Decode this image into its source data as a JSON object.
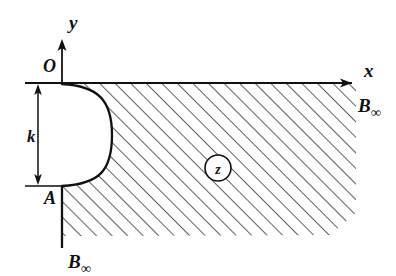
{
  "figure": {
    "kind": "complex-plane-region-diagram",
    "width": 396,
    "height": 276,
    "background_color": "#ffffff",
    "ink_color": "#111111"
  },
  "axes": {
    "x_axis": {
      "label": "x",
      "direction": "right",
      "arrowhead": true,
      "y_position": 83,
      "x_start": 25,
      "x_end": 358
    },
    "y_axis": {
      "label": "y",
      "direction": "up",
      "arrowhead": true,
      "x_position": 62,
      "y_start": 83,
      "y_end": 38
    },
    "origin_label": "O"
  },
  "points": {
    "origin": {
      "label": "O",
      "x": 62,
      "y": 83
    },
    "A": {
      "label": "A",
      "x": 62,
      "y": 186
    }
  },
  "dimension": {
    "label": "k",
    "description": "vertical double-arrow between the level of O and the level of A",
    "from_y": 83,
    "to_y": 186,
    "arrow_x": 38,
    "tick_x_start": 25,
    "tick_x_end": 62,
    "double_headed": true
  },
  "boundary": {
    "indentation": {
      "shape": "semicircular-bulge",
      "from": "O",
      "to": "A",
      "max_x": 110,
      "mid_y": 135
    },
    "lower_vertical_segment": {
      "from_x": 62,
      "from_y": 186,
      "to_x": 62,
      "to_y": 248
    }
  },
  "labels": {
    "b_infinity_right": {
      "base": "B",
      "subscript": "∞",
      "x": 368,
      "y": 112
    },
    "b_infinity_bottom": {
      "base": "B",
      "subscript": "∞",
      "x": 66,
      "y": 264
    },
    "region": {
      "text": "z",
      "circled": true,
      "cx": 218,
      "cy": 168,
      "r": 13
    }
  },
  "hatching": {
    "description": "45-degree parallel lines rising to the right filling the region right of the indented boundary and below the x-axis",
    "angle_degrees": 45,
    "spacing_px": 11,
    "stroke_width": 1.3,
    "color": "#111111"
  }
}
